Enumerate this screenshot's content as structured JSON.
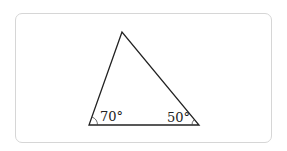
{
  "diagram": {
    "type": "triangle",
    "vertices": {
      "apex": [
        122,
        32
      ],
      "bottom_left": [
        89,
        125
      ],
      "bottom_right": [
        199,
        125
      ]
    },
    "angles": [
      {
        "vertex": "bottom_left",
        "label": "70°"
      },
      {
        "vertex": "bottom_right",
        "label": "50°"
      }
    ]
  }
}
